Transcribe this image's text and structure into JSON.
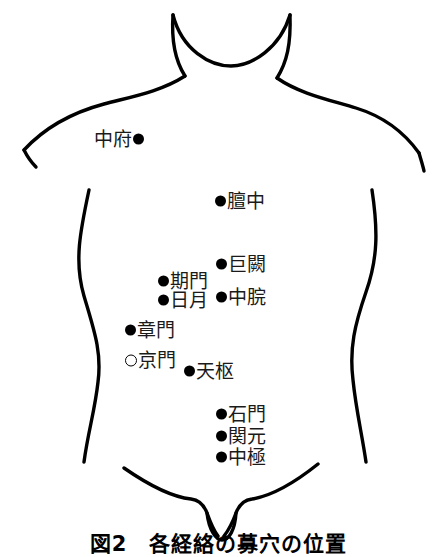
{
  "figure": {
    "caption": "図2　各経絡の募穴の位置",
    "title": "各経絡の募穴の位置",
    "figure_number": "図2",
    "line_color": "#000000",
    "marker_filled_color": "#000000",
    "marker_hollow_color": "#ffffff",
    "background_color": "#ffffff"
  },
  "points": [
    {
      "label": "中府",
      "marker": "filled",
      "label_side": "left",
      "x": 105,
      "y": 139,
      "marker_name": "acupoint-marker-zhongfu"
    },
    {
      "label": "膻中",
      "marker": "filled",
      "label_side": "right",
      "x": 220,
      "y": 201,
      "marker_name": "acupoint-marker-danzhong"
    },
    {
      "label": "巨闕",
      "marker": "filled",
      "label_side": "right",
      "x": 221,
      "y": 264,
      "marker_name": "acupoint-marker-juque"
    },
    {
      "label": "期門",
      "marker": "filled",
      "label_side": "right",
      "x": 163,
      "y": 281,
      "marker_name": "acupoint-marker-qimen"
    },
    {
      "label": "中脘",
      "marker": "filled",
      "label_side": "right",
      "x": 221,
      "y": 297,
      "marker_name": "acupoint-marker-zhongwan"
    },
    {
      "label": "日月",
      "marker": "filled",
      "label_side": "right",
      "x": 163,
      "y": 300,
      "marker_name": "acupoint-marker-riyue"
    },
    {
      "label": "章門",
      "marker": "filled",
      "label_side": "right",
      "x": 130,
      "y": 330,
      "marker_name": "acupoint-marker-zhangmen"
    },
    {
      "label": "京門",
      "marker": "hollow",
      "label_side": "right",
      "x": 130,
      "y": 360,
      "marker_name": "acupoint-marker-jingmen"
    },
    {
      "label": "天枢",
      "marker": "filled",
      "label_side": "right",
      "x": 189,
      "y": 371,
      "marker_name": "acupoint-marker-tianshu"
    },
    {
      "label": "石門",
      "marker": "filled",
      "label_side": "right",
      "x": 221,
      "y": 414,
      "marker_name": "acupoint-marker-shimen"
    },
    {
      "label": "関元",
      "marker": "filled",
      "label_side": "right",
      "x": 221,
      "y": 436,
      "marker_name": "acupoint-marker-guanyuan"
    },
    {
      "label": "中極",
      "marker": "filled",
      "label_side": "right",
      "x": 221,
      "y": 457,
      "marker_name": "acupoint-marker-zhongji"
    }
  ]
}
